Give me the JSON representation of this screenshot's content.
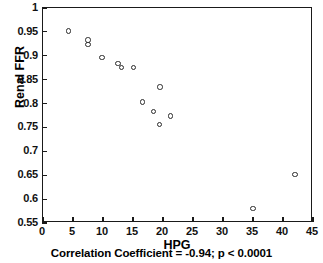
{
  "chart_data": {
    "type": "scatter",
    "title": "",
    "xlabel": "HPG",
    "ylabel": "Renal FFR",
    "xlim": [
      0,
      45
    ],
    "ylim": [
      0.55,
      1
    ],
    "grid": false,
    "legend": null,
    "xticks": [
      "0",
      "5",
      "10",
      "15",
      "20",
      "25",
      "30",
      "35",
      "40",
      "45"
    ],
    "xtick_values": [
      0,
      5,
      10,
      15,
      20,
      25,
      30,
      35,
      40,
      45
    ],
    "yticks": [
      "0.55",
      "0.6",
      "0.65",
      "0.7",
      "0.75",
      "0.8",
      "0.85",
      "0.9",
      "0.95",
      "1"
    ],
    "ytick_values": [
      0.55,
      0.6,
      0.65,
      0.7,
      0.75,
      0.8,
      0.85,
      0.9,
      0.95,
      1
    ],
    "marker": "open-circle",
    "marker_color": "#2b2b2b",
    "points": [
      {
        "x": 4.2,
        "y": 0.952
      },
      {
        "x": 7.5,
        "y": 0.933
      },
      {
        "x": 7.5,
        "y": 0.924
      },
      {
        "x": 9.8,
        "y": 0.896
      },
      {
        "x": 12.5,
        "y": 0.884
      },
      {
        "x": 13.1,
        "y": 0.876
      },
      {
        "x": 15.1,
        "y": 0.875
      },
      {
        "x": 19.5,
        "y": 0.835
      },
      {
        "x": 16.6,
        "y": 0.803
      },
      {
        "x": 18.4,
        "y": 0.784
      },
      {
        "x": 21.2,
        "y": 0.774
      },
      {
        "x": 19.4,
        "y": 0.756
      },
      {
        "x": 42.0,
        "y": 0.652
      },
      {
        "x": 35.0,
        "y": 0.58
      }
    ],
    "annotations": [
      "Correlation Coefficient = -0.94; p < 0.0001"
    ],
    "correlation_coefficient": -0.94,
    "p_value": "< 0.0001"
  },
  "caption": {
    "text": "Correlation Coefficient = -0.94; p < 0.0001"
  }
}
